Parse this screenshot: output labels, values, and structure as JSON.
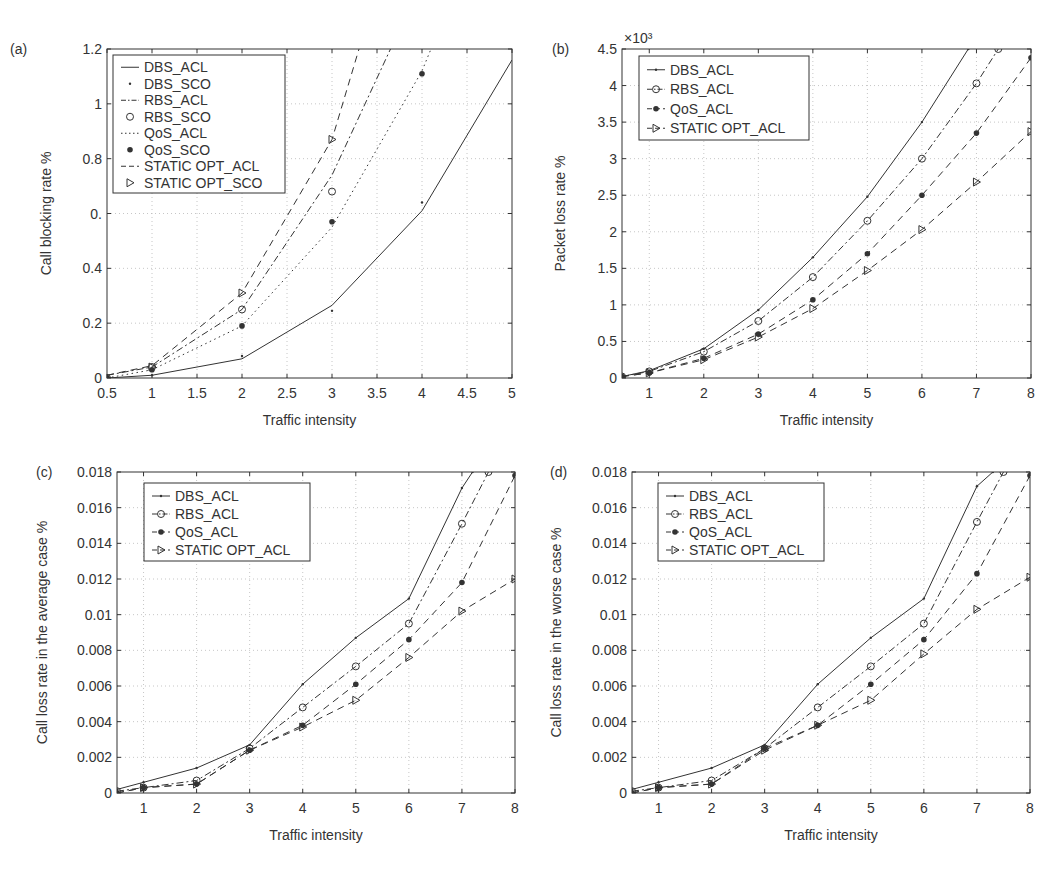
{
  "chart_data": [
    {
      "id": "a",
      "panel_label": "(a)",
      "type": "line",
      "title": "",
      "xlabel": "Traffic intensity",
      "ylabel": "Call blocking rate %",
      "xlim": [
        0.5,
        5
      ],
      "ylim": [
        0,
        1.2
      ],
      "xticks": [
        0.5,
        1,
        1.5,
        2,
        2.5,
        3,
        3.5,
        4,
        4.5,
        5
      ],
      "xtick_labels": [
        "0.5",
        "1",
        "1.5",
        "2",
        "2.5",
        "3",
        "3.5",
        "4",
        "4.5",
        "5"
      ],
      "yticks": [
        0,
        0.2,
        0.4,
        0.6,
        0.8,
        1,
        1.2
      ],
      "ytick_labels": [
        "0",
        "0.2",
        "0.4",
        "0.",
        "0.8",
        "1",
        "1.2"
      ],
      "exponent_label": "",
      "grid": true,
      "legend_position": "upper left",
      "plot_box": {
        "left": 107,
        "right": 512,
        "top": 49,
        "bottom": 378
      },
      "legend_box": {
        "x": 113,
        "y": 55,
        "w": 172,
        "h": 138
      },
      "series": [
        {
          "name": "DBS_ACL",
          "line": "solid",
          "marker": "none",
          "x": [
            0.5,
            1,
            2,
            3,
            4,
            5
          ],
          "y": [
            0.0,
            0.01,
            0.07,
            0.265,
            0.61,
            1.16
          ]
        },
        {
          "name": "DBS_SCO",
          "line": "none",
          "marker": "point",
          "x": [
            0.5,
            1,
            2,
            3,
            4
          ],
          "y": [
            0.0,
            0.01,
            0.08,
            0.245,
            0.64
          ]
        },
        {
          "name": "RBS_ACL",
          "line": "dashdot",
          "marker": "none",
          "x": [
            0.5,
            1,
            2,
            3,
            3.65
          ],
          "y": [
            0.01,
            0.04,
            0.25,
            0.74,
            1.2
          ]
        },
        {
          "name": "RBS_SCO",
          "line": "none",
          "marker": "circle",
          "x": [
            0.5,
            1,
            2,
            3
          ],
          "y": [
            0.0,
            0.04,
            0.25,
            0.68
          ]
        },
        {
          "name": "QoS_ACL",
          "line": "dotted",
          "marker": "none",
          "x": [
            0.5,
            1,
            2,
            3,
            4,
            4.1
          ],
          "y": [
            0.0,
            0.03,
            0.19,
            0.55,
            1.12,
            1.2
          ]
        },
        {
          "name": "QoS_SCO",
          "line": "none",
          "marker": "filled",
          "x": [
            0.5,
            1,
            2,
            3,
            4
          ],
          "y": [
            0.0,
            0.03,
            0.19,
            0.57,
            1.11
          ]
        },
        {
          "name": "STATIC OPT_ACL",
          "line": "dashed",
          "marker": "none",
          "x": [
            0.5,
            1,
            2,
            3,
            3.3
          ],
          "y": [
            0.01,
            0.045,
            0.31,
            0.87,
            1.2
          ]
        },
        {
          "name": "STATIC OPT_SCO",
          "line": "none",
          "marker": "triangle",
          "x": [
            0.5,
            1,
            2,
            3
          ],
          "y": [
            0.0,
            0.04,
            0.31,
            0.87
          ]
        }
      ]
    },
    {
      "id": "b",
      "panel_label": "(b)",
      "type": "line",
      "title": "",
      "xlabel": "Traffic intensity",
      "ylabel": "Packet loss rate %",
      "xlim": [
        0.5,
        8
      ],
      "ylim": [
        0,
        4.5
      ],
      "xticks": [
        1,
        2,
        3,
        4,
        5,
        6,
        7,
        8
      ],
      "xtick_labels": [
        "1",
        "2",
        "3",
        "4",
        "5",
        "6",
        "7",
        "8"
      ],
      "yticks": [
        0,
        0.5,
        1,
        1.5,
        2,
        2.5,
        3,
        3.5,
        4,
        4.5
      ],
      "ytick_labels": [
        "0",
        "0.5",
        "1",
        "1.5",
        "2",
        "2.5",
        "3",
        "3.5",
        "4",
        "4.5"
      ],
      "exponent_label": "×10³",
      "grid": true,
      "legend_position": "upper left",
      "plot_box": {
        "left": 622,
        "right": 1031,
        "top": 49,
        "bottom": 378
      },
      "legend_box": {
        "x": 639,
        "y": 56,
        "w": 170,
        "h": 84
      },
      "series": [
        {
          "name": "DBS_ACL",
          "line": "solid",
          "marker": "point",
          "x": [
            0.5,
            1,
            2,
            3,
            4,
            5,
            6,
            6.85
          ],
          "y": [
            0.02,
            0.1,
            0.4,
            0.93,
            1.65,
            2.48,
            3.5,
            4.5
          ]
        },
        {
          "name": "RBS_ACL",
          "line": "dashdot",
          "marker": "circle",
          "x": [
            0.5,
            1,
            2,
            3,
            4,
            5,
            6,
            7,
            7.4
          ],
          "y": [
            0.02,
            0.09,
            0.36,
            0.78,
            1.38,
            2.15,
            3.0,
            4.03,
            4.5
          ]
        },
        {
          "name": "QoS_ACL",
          "line": "dashed",
          "marker": "filled",
          "x": [
            0.5,
            1,
            2,
            3,
            4,
            5,
            6,
            7,
            8
          ],
          "y": [
            0.02,
            0.07,
            0.27,
            0.6,
            1.07,
            1.7,
            2.5,
            3.35,
            4.38
          ]
        },
        {
          "name": "STATIC OPT_ACL",
          "line": "dashed",
          "marker": "triangle",
          "x": [
            0.5,
            1,
            2,
            3,
            4,
            5,
            6,
            7,
            8
          ],
          "y": [
            0.02,
            0.07,
            0.25,
            0.56,
            0.95,
            1.47,
            2.03,
            2.68,
            3.37
          ]
        }
      ]
    },
    {
      "id": "c",
      "panel_label": "(c)",
      "type": "line",
      "title": "",
      "xlabel": "Traffic intensity",
      "ylabel": "Call loss rate in the average case %",
      "xlim": [
        0.5,
        8
      ],
      "ylim": [
        0,
        0.018
      ],
      "xticks": [
        1,
        2,
        3,
        4,
        5,
        6,
        7,
        8
      ],
      "xtick_labels": [
        "1",
        "2",
        "3",
        "4",
        "5",
        "6",
        "7",
        "8"
      ],
      "yticks": [
        0,
        0.002,
        0.004,
        0.006,
        0.008,
        0.01,
        0.012,
        0.014,
        0.016,
        0.018
      ],
      "ytick_labels": [
        "0",
        "0.002",
        "0.004",
        "0.006",
        "0.008",
        "0.01",
        "0.012",
        "0.014",
        "0.016",
        "0.018"
      ],
      "exponent_label": "",
      "grid": true,
      "legend_position": "upper left",
      "plot_box": {
        "left": 117,
        "right": 515,
        "top": 472,
        "bottom": 793
      },
      "legend_box": {
        "x": 144,
        "y": 483,
        "w": 166,
        "h": 78
      },
      "series": [
        {
          "name": "DBS_ACL",
          "line": "solid",
          "marker": "point",
          "x": [
            0.5,
            1,
            2,
            3,
            4,
            5,
            6,
            7,
            7.2
          ],
          "y": [
            0.0002,
            0.0006,
            0.0014,
            0.0027,
            0.0061,
            0.0087,
            0.0109,
            0.0171,
            0.018
          ]
        },
        {
          "name": "RBS_ACL",
          "line": "dashdot",
          "marker": "circle",
          "x": [
            0.5,
            1,
            2,
            3,
            4,
            5,
            6,
            7,
            7.5
          ],
          "y": [
            0.0001,
            0.0003,
            0.0007,
            0.0025,
            0.0048,
            0.0071,
            0.0095,
            0.0151,
            0.018
          ]
        },
        {
          "name": "QoS_ACL",
          "line": "dashed",
          "marker": "filled",
          "x": [
            0.5,
            1,
            2,
            3,
            4,
            5,
            6,
            7,
            8
          ],
          "y": [
            0.0,
            0.0003,
            0.0005,
            0.0024,
            0.0038,
            0.0061,
            0.0086,
            0.0118,
            0.0178
          ]
        },
        {
          "name": "STATIC OPT_ACL",
          "line": "dashed",
          "marker": "triangle",
          "x": [
            0.5,
            1,
            2,
            3,
            4,
            5,
            6,
            7,
            8
          ],
          "y": [
            0.0,
            0.0003,
            0.0005,
            0.0024,
            0.0037,
            0.0052,
            0.0076,
            0.0102,
            0.012
          ]
        }
      ]
    },
    {
      "id": "d",
      "panel_label": "(d)",
      "type": "line",
      "title": "",
      "xlabel": "Traffic intensity",
      "ylabel": "Call loss rate in the worse case %",
      "xlim": [
        0.5,
        8
      ],
      "ylim": [
        0,
        0.018
      ],
      "xticks": [
        1,
        2,
        3,
        4,
        5,
        6,
        7,
        8
      ],
      "xtick_labels": [
        "1",
        "2",
        "3",
        "4",
        "5",
        "6",
        "7",
        "8"
      ],
      "yticks": [
        0,
        0.002,
        0.004,
        0.006,
        0.008,
        0.01,
        0.012,
        0.014,
        0.016,
        0.018
      ],
      "ytick_labels": [
        "0",
        "0.002",
        "0.004",
        "0.006",
        "0.008",
        "0.01",
        "0.012",
        "0.014",
        "0.016",
        "0.018"
      ],
      "exponent_label": "",
      "grid": true,
      "legend_position": "upper left",
      "plot_box": {
        "left": 632,
        "right": 1030,
        "top": 472,
        "bottom": 793
      },
      "legend_box": {
        "x": 658,
        "y": 483,
        "w": 166,
        "h": 78
      },
      "series": [
        {
          "name": "DBS_ACL",
          "line": "solid",
          "marker": "point",
          "x": [
            0.5,
            1,
            2,
            3,
            4,
            5,
            6,
            7,
            7.3
          ],
          "y": [
            0.0002,
            0.0006,
            0.0014,
            0.0027,
            0.0061,
            0.0087,
            0.0109,
            0.0172,
            0.018
          ]
        },
        {
          "name": "RBS_ACL",
          "line": "dashdot",
          "marker": "circle",
          "x": [
            0.5,
            1,
            2,
            3,
            4,
            5,
            6,
            7,
            7.5
          ],
          "y": [
            0.0001,
            0.0003,
            0.0007,
            0.0025,
            0.0048,
            0.0071,
            0.0095,
            0.0152,
            0.018
          ]
        },
        {
          "name": "QoS_ACL",
          "line": "dashed",
          "marker": "filled",
          "x": [
            0.5,
            1,
            2,
            3,
            4,
            5,
            6,
            7,
            8
          ],
          "y": [
            0.0,
            0.0003,
            0.0005,
            0.0025,
            0.0038,
            0.0061,
            0.0086,
            0.0123,
            0.0178
          ]
        },
        {
          "name": "STATIC OPT_ACL",
          "line": "dashed",
          "marker": "triangle",
          "x": [
            0.5,
            1,
            2,
            3,
            4,
            5,
            6,
            7,
            8
          ],
          "y": [
            0.0,
            0.0003,
            0.0005,
            0.0024,
            0.0038,
            0.0052,
            0.0078,
            0.0103,
            0.0121
          ]
        }
      ]
    }
  ],
  "colors": {
    "ink": "#333333",
    "grid": "#b8b8b8",
    "background": "#ffffff"
  }
}
